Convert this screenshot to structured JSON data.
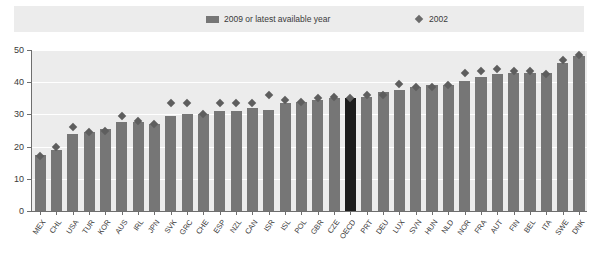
{
  "legend": {
    "series1_label": "2009 or latest available year",
    "series2_label": "2002",
    "series1_icon": "bar-swatch-icon",
    "series2_icon": "diamond-marker-icon",
    "series1_color": "#767676",
    "series2_color": "#5e5e5e"
  },
  "axis": {
    "y_ticks": [
      "0",
      "10",
      "20",
      "30",
      "40",
      "50"
    ],
    "y_min": 0,
    "y_max": 50
  },
  "colors": {
    "plot_background": "#ececec",
    "bar": "#767676",
    "bar_highlight": "#1c1c1c",
    "marker": "#5e5e5e",
    "gridline": "#ffffff",
    "axis": "#6e6e6e"
  },
  "chart_data": {
    "type": "bar",
    "title": "",
    "xlabel": "",
    "ylabel": "",
    "ylim": [
      0,
      50
    ],
    "grid": true,
    "legend_position": "top",
    "categories": [
      "MEX",
      "CHL",
      "USA",
      "TUR",
      "KOR",
      "AUS",
      "IRL",
      "JPN",
      "SVK",
      "GRC",
      "CHE",
      "ESP",
      "NZL",
      "CAN",
      "ISR",
      "ISL",
      "POL",
      "GBR",
      "CZE",
      "OECD",
      "PRT",
      "DEU",
      "LUX",
      "SVN",
      "HUN",
      "NLD",
      "NOR",
      "FRA",
      "AUT",
      "FIN",
      "BEL",
      "ITA",
      "SWE",
      "DNK"
    ],
    "highlight_category": "OECD",
    "series": [
      {
        "name": "2009 or latest available year",
        "type": "bar",
        "values": [
          17.5,
          19.0,
          24.0,
          24.5,
          25.5,
          27.5,
          27.5,
          27.0,
          29.5,
          30.0,
          30.0,
          31.0,
          31.0,
          32.0,
          31.5,
          33.5,
          34.0,
          34.5,
          35.0,
          35.0,
          35.5,
          37.0,
          37.5,
          38.5,
          39.0,
          39.0,
          40.5,
          41.5,
          42.5,
          43.0,
          43.0,
          43.0,
          46.0,
          48.0
        ]
      },
      {
        "name": "2002",
        "type": "scatter",
        "values": [
          17.0,
          20.0,
          26.0,
          24.5,
          25.0,
          29.5,
          28.0,
          27.0,
          33.5,
          33.5,
          30.0,
          33.5,
          33.5,
          33.5,
          36.0,
          34.5,
          34.0,
          35.0,
          35.5,
          35.0,
          36.0,
          36.0,
          39.5,
          38.5,
          38.5,
          39.0,
          43.0,
          43.5,
          44.0,
          43.5,
          43.5,
          42.5,
          47.0,
          48.5
        ]
      }
    ]
  }
}
